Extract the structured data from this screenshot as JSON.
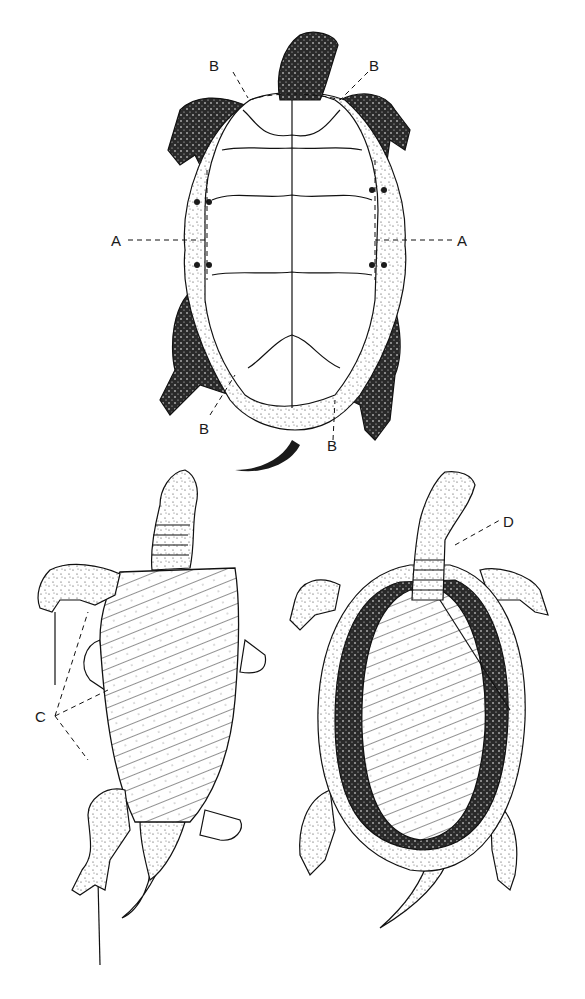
{
  "figure": {
    "labels": {
      "A_left": "A",
      "A_right": "A",
      "B_top_left": "B",
      "B_top_right": "B",
      "B_bottom_left": "B",
      "B_bottom_right": "B",
      "C": "C",
      "D": "D"
    },
    "panels": [
      {
        "name": "top",
        "view": "ventral view, plastron intact, cut lines A and B"
      },
      {
        "name": "bottom-left",
        "view": "plastron being lifted, limbs pinned, label C"
      },
      {
        "name": "bottom-right",
        "view": "plastron removed showing body cavity, label D"
      }
    ],
    "colors": {
      "ink": "#111111",
      "background": "#ffffff"
    }
  }
}
